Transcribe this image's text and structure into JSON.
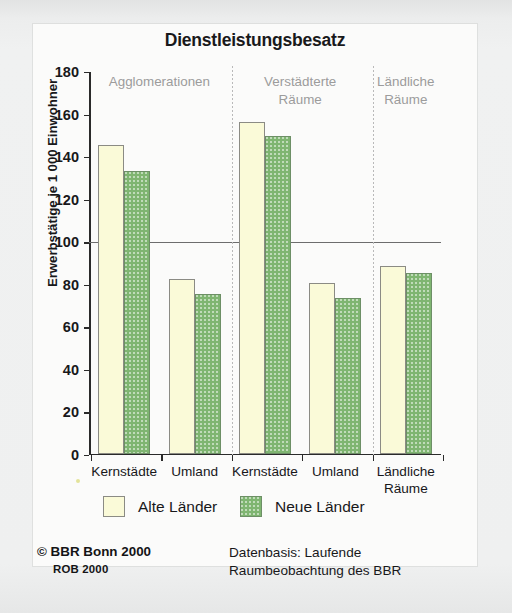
{
  "chart_data": {
    "type": "bar",
    "title": "Dienstleistungsbesatz",
    "xlabel": "",
    "ylabel": "Erwerbstätige je 1 000 Einwohner",
    "ylim": [
      0,
      180
    ],
    "yticks": [
      0,
      20,
      40,
      60,
      80,
      100,
      120,
      140,
      160,
      180
    ],
    "grid": false,
    "reference_line": 100,
    "legend_position": "bottom",
    "categories": [
      "Kernstädte",
      "Umland",
      "Kernstädte",
      "Umland",
      "Ländliche\nRäume"
    ],
    "group_headers": [
      {
        "label": "Agglomerationen",
        "categories": [
          "Kernstädte",
          "Umland"
        ]
      },
      {
        "label": "Verstädterte\nRäume",
        "categories": [
          "Kernstädte",
          "Umland"
        ]
      },
      {
        "label": "Ländliche\nRäume",
        "categories": [
          "Ländliche Räume"
        ]
      }
    ],
    "series": [
      {
        "name": "Alte Länder",
        "color": "#fafad8",
        "values": [
          145,
          82,
          156,
          80,
          88
        ]
      },
      {
        "name": "Neue Länder",
        "color": "#7fb571",
        "values": [
          133,
          75,
          149,
          73,
          85
        ]
      }
    ]
  },
  "legend": {
    "items": [
      {
        "label": "Alte Länder",
        "swatch": "alte"
      },
      {
        "label": "Neue Länder",
        "swatch": "neue"
      }
    ]
  },
  "footer": {
    "copyright": "© BBR Bonn 2000",
    "rob": "ROB 2000",
    "source": "Datenbasis: Laufende\nRaumbeobachtung des BBR"
  }
}
